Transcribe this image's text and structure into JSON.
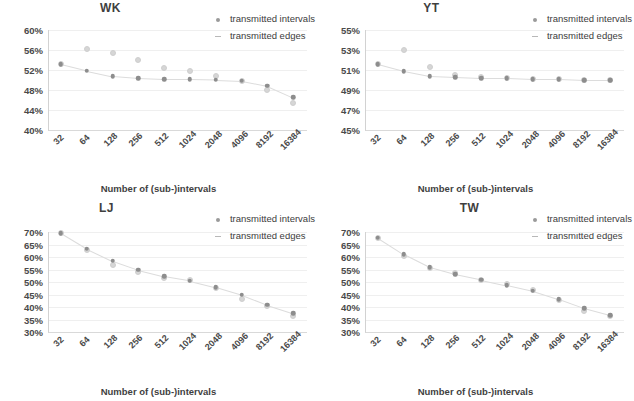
{
  "figure": {
    "xlabel": "Number of (sub-)intervals",
    "legend": [
      {
        "label": "transmitted intervals",
        "marker": "dot-marker",
        "color": "#8d8d8d"
      },
      {
        "label": "transmitted edges",
        "marker": "dash-marker",
        "color": "#d6d6d6"
      }
    ]
  },
  "chart_data": [
    {
      "type": "scatter",
      "title": "WK",
      "xlabel": "Number of (sub-)intervals",
      "ylabel": "",
      "categories": [
        "32",
        "64",
        "128",
        "256",
        "512",
        "1024",
        "2048",
        "4096",
        "8192",
        "16384"
      ],
      "yticks": [
        "40%",
        "44%",
        "48%",
        "52%",
        "56%",
        "60%"
      ],
      "ylim": [
        40,
        60
      ],
      "ystep": 4,
      "grid": true,
      "legend_position": "top-right",
      "series": [
        {
          "name": "transmitted intervals",
          "values": [
            53.2,
            51.9,
            50.8,
            50.4,
            50.2,
            50.2,
            50.1,
            49.9,
            48.9,
            46.6
          ]
        },
        {
          "name": "transmitted edges",
          "values": [
            53.2,
            56.3,
            55.4,
            54.1,
            52.4,
            51.8,
            50.8,
            49.9,
            48.1,
            45.5
          ]
        }
      ]
    },
    {
      "type": "scatter",
      "title": "YT",
      "xlabel": "Number of (sub-)intervals",
      "ylabel": "",
      "categories": [
        "32",
        "64",
        "128",
        "256",
        "512",
        "1024",
        "2048",
        "4096",
        "8192",
        "16384"
      ],
      "yticks": [
        "45%",
        "47%",
        "49%",
        "51%",
        "53%",
        "55%"
      ],
      "ylim": [
        45,
        55
      ],
      "ystep": 2,
      "grid": true,
      "legend_position": "top-right",
      "series": [
        {
          "name": "transmitted intervals",
          "values": [
            51.6,
            50.9,
            50.4,
            50.3,
            50.2,
            50.2,
            50.1,
            50.1,
            50.0,
            50.0
          ]
        },
        {
          "name": "transmitted edges",
          "values": [
            51.6,
            53.0,
            51.3,
            50.5,
            50.3,
            50.2,
            50.1,
            50.1,
            50.0,
            50.0
          ]
        }
      ]
    },
    {
      "type": "scatter",
      "title": "LJ",
      "xlabel": "Number of (sub-)intervals",
      "ylabel": "",
      "categories": [
        "32",
        "64",
        "128",
        "256",
        "512",
        "1024",
        "2048",
        "4096",
        "8192",
        "16384"
      ],
      "yticks": [
        "30%",
        "35%",
        "40%",
        "45%",
        "50%",
        "55%",
        "60%",
        "65%",
        "70%"
      ],
      "ylim": [
        30,
        70
      ],
      "ystep": 5,
      "grid": true,
      "legend_position": "top-right",
      "series": [
        {
          "name": "transmitted intervals",
          "values": [
            69.6,
            63.4,
            58.5,
            54.9,
            52.3,
            50.6,
            48.0,
            44.9,
            40.9,
            37.6
          ]
        },
        {
          "name": "transmitted edges",
          "values": [
            69.6,
            63.0,
            56.8,
            54.0,
            51.5,
            50.9,
            47.5,
            43.2,
            40.5,
            36.6
          ]
        }
      ]
    },
    {
      "type": "scatter",
      "title": "TW",
      "xlabel": "Number of (sub-)intervals",
      "ylabel": "",
      "categories": [
        "32",
        "64",
        "128",
        "256",
        "512",
        "1024",
        "2048",
        "4096",
        "8192",
        "16384"
      ],
      "yticks": [
        "30%",
        "35%",
        "40%",
        "45%",
        "50%",
        "55%",
        "60%",
        "65%",
        "70%"
      ],
      "ylim": [
        30,
        70
      ],
      "ystep": 5,
      "grid": true,
      "legend_position": "top-right",
      "series": [
        {
          "name": "transmitted intervals",
          "values": [
            67.8,
            61.2,
            56.0,
            53.1,
            51.0,
            48.8,
            46.5,
            43.2,
            39.5,
            36.7
          ]
        },
        {
          "name": "transmitted edges",
          "values": [
            67.8,
            60.5,
            55.8,
            53.6,
            50.8,
            49.2,
            46.8,
            42.9,
            38.5,
            36.5
          ]
        }
      ]
    }
  ]
}
